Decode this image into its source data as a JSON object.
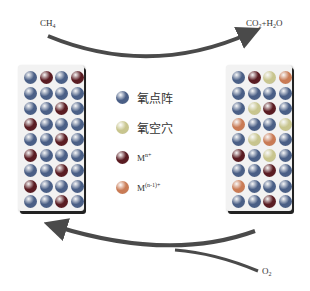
{
  "labels": {
    "reactant_top": {
      "base": "CH",
      "sub": "4"
    },
    "product_top": {
      "p1": "CO",
      "sub1": "2",
      "p2": "+H",
      "sub2": "2",
      "p3": "O"
    },
    "reactant_bottom": {
      "base": "O",
      "sub": "2"
    }
  },
  "legend": [
    {
      "key": "O",
      "label": "氧点阵",
      "color": "#4a5f86"
    },
    {
      "key": "V",
      "label": "氧空穴",
      "color": "#c8c58e"
    },
    {
      "key": "D",
      "label": "M",
      "sup": "n+",
      "color": "#5a1c22"
    },
    {
      "key": "M1",
      "label": "M",
      "sup": "(n-1)+",
      "color": "#c97b55"
    }
  ],
  "colors": {
    "O": "#4a5f86",
    "V": "#c8c58e",
    "D": "#5a1c22",
    "M1": "#c97b55",
    "arrow": "#4a4a4a"
  },
  "left_grid": [
    [
      "O",
      "D",
      "O",
      "D"
    ],
    [
      "O",
      "O",
      "O",
      "O"
    ],
    [
      "O",
      "O",
      "D",
      "O"
    ],
    [
      "D",
      "O",
      "O",
      "O"
    ],
    [
      "O",
      "O",
      "D",
      "O"
    ],
    [
      "D",
      "O",
      "O",
      "O"
    ],
    [
      "O",
      "O",
      "D",
      "O"
    ],
    [
      "D",
      "O",
      "O",
      "O"
    ],
    [
      "O",
      "O",
      "D",
      "O"
    ]
  ],
  "right_grid": [
    [
      "O",
      "D",
      "V",
      "M1"
    ],
    [
      "O",
      "O",
      "O",
      "O"
    ],
    [
      "O",
      "V",
      "D",
      "O"
    ],
    [
      "M1",
      "O",
      "O",
      "V"
    ],
    [
      "O",
      "V",
      "M1",
      "O"
    ],
    [
      "D",
      "O",
      "V",
      "O"
    ],
    [
      "O",
      "O",
      "D",
      "O"
    ],
    [
      "M1",
      "O",
      "O",
      "O"
    ],
    [
      "O",
      "O",
      "D",
      "O"
    ]
  ]
}
